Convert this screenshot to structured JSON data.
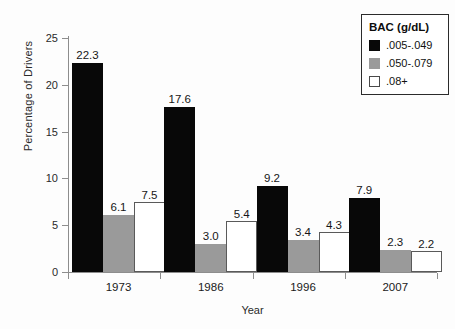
{
  "chart_data": {
    "type": "bar",
    "title": "",
    "subtitle": "",
    "xlabel": "Year",
    "ylabel": "Percentage of Drivers",
    "categories": [
      "1973",
      "1986",
      "1996",
      "2007"
    ],
    "series": [
      {
        "name": ".005-.049",
        "color": "#080808",
        "values": [
          22.3,
          17.6,
          9.2,
          7.9
        ]
      },
      {
        "name": ".050-.079",
        "color": "#9a9a9a",
        "values": [
          6.1,
          3.0,
          3.4,
          2.3
        ]
      },
      {
        "name": ".08+",
        "color": "#ffffff",
        "values": [
          7.5,
          5.4,
          4.3,
          2.2
        ]
      }
    ],
    "value_labels": [
      [
        "22.3",
        "6.1",
        "7.5"
      ],
      [
        "17.6",
        "3.0",
        "5.4"
      ],
      [
        "9.2",
        "3.4",
        "4.3"
      ],
      [
        "7.9",
        "2.3",
        "2.2"
      ]
    ],
    "ylim": [
      0,
      25
    ],
    "ytick_values": [
      0,
      5,
      10,
      15,
      20,
      25
    ],
    "ytick_labels": [
      "0",
      "5",
      "10",
      "15",
      "20",
      "25"
    ],
    "grid": false,
    "legend": {
      "position": "top-right",
      "title": "BAC (g/dL)",
      "entries": [
        {
          "label": ".005-.049",
          "swatch": "black-swatch"
        },
        {
          "label": ".050-.079",
          "swatch": "gray-swatch"
        },
        {
          "label": ".08+",
          "swatch": "white-swatch"
        }
      ]
    }
  }
}
